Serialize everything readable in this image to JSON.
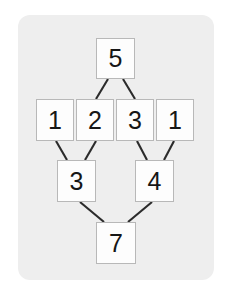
{
  "card": {
    "background_color": "#eeeeee",
    "corner_radius_px": 12
  },
  "diagram": {
    "cell_fill_color": "#fdfdfd",
    "cell_border_color": "#b8b8b8",
    "edge_color": "#2b2b2b",
    "rows": [
      {
        "row": 1,
        "cells": [
          {
            "id": "r1c1",
            "value": "5"
          }
        ]
      },
      {
        "row": 2,
        "cells": [
          {
            "id": "r2c1",
            "value": "1"
          },
          {
            "id": "r2c2",
            "value": "2"
          },
          {
            "id": "r2c3",
            "value": "3"
          },
          {
            "id": "r2c4",
            "value": "1"
          }
        ]
      },
      {
        "row": 3,
        "cells": [
          {
            "id": "r3c1",
            "value": "3"
          },
          {
            "id": "r3c2",
            "value": "4"
          }
        ]
      },
      {
        "row": 4,
        "cells": [
          {
            "id": "r4c1",
            "value": "7"
          }
        ]
      }
    ],
    "edges": [
      {
        "from": "r1c1",
        "to": "r2c2"
      },
      {
        "from": "r1c1",
        "to": "r2c3"
      },
      {
        "from": "r2c1",
        "to": "r3c1"
      },
      {
        "from": "r2c2",
        "to": "r3c1"
      },
      {
        "from": "r2c3",
        "to": "r3c2"
      },
      {
        "from": "r2c4",
        "to": "r3c2"
      },
      {
        "from": "r3c1",
        "to": "r4c1"
      },
      {
        "from": "r3c2",
        "to": "r4c1"
      }
    ]
  }
}
